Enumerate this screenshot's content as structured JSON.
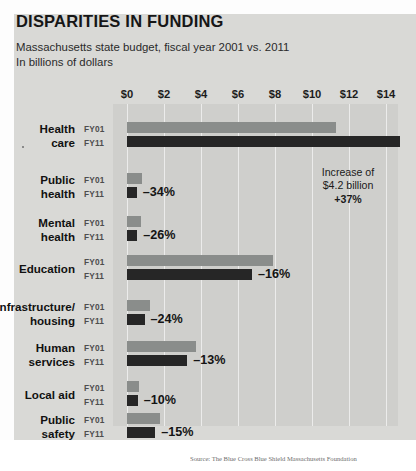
{
  "figure": {
    "title": "DISPARITIES IN FUNDING",
    "subtitle_line1": "Massachusetts state budget, fiscal year 2001 vs. 2011",
    "subtitle_line2": "In billions of dollars",
    "source": "Source: The Blue Cross Blue Shield Massachusetts Foundation"
  },
  "annotation": {
    "line1": "Increase of",
    "line2": "$4.2 billion",
    "line3": "+37%"
  },
  "series_labels": {
    "fy01": "FY01",
    "fy11": "FY11"
  },
  "colors": {
    "fy01_bar": "#8a8d8b",
    "fy11_bar": "#262626",
    "plot_background": "#cfcfcc",
    "figure_background": "#d9d9d6",
    "gridline": "#ececeb"
  },
  "chart_data": {
    "type": "bar",
    "orientation": "horizontal",
    "title": "DISPARITIES IN FUNDING",
    "subtitle": "Massachusetts state budget, fiscal year 2001 vs. 2011",
    "xlabel": "In billions of dollars",
    "ylabel": "",
    "xlim": [
      0,
      14.8
    ],
    "grid": true,
    "legend": "none",
    "tick_labels": [
      "$0",
      "$2",
      "$4",
      "$6",
      "$8",
      "$10",
      "$12",
      "$14"
    ],
    "tick_values": [
      0,
      2,
      4,
      6,
      8,
      10,
      12,
      14
    ],
    "categories": [
      "Health care",
      "Public health",
      "Mental health",
      "Education",
      "Infrastructure/ housing",
      "Human services",
      "Local aid",
      "Public safety"
    ],
    "series": [
      {
        "name": "FY01",
        "values": [
          11.3,
          0.8,
          0.75,
          7.9,
          1.25,
          3.73,
          0.64,
          1.8
        ]
      },
      {
        "name": "FY11",
        "values": [
          15.5,
          0.53,
          0.55,
          6.75,
          0.95,
          3.25,
          0.58,
          1.53
        ]
      }
    ],
    "change_labels": [
      "+37%",
      "-34%",
      "-26%",
      "-16%",
      "-24%",
      "-13%",
      "-10%",
      "-15%"
    ],
    "annotations": [
      {
        "category": "Health care",
        "text": "Increase of $4.2 billion +37%"
      }
    ]
  },
  "rows": [
    {
      "label_line1": "Health",
      "label_line2": "care",
      "fy01_value": 11.3,
      "fy11_value": 15.5,
      "change": "",
      "show_change": false
    },
    {
      "label_line1": "Public",
      "label_line2": "health",
      "fy01_value": 0.8,
      "fy11_value": 0.53,
      "change": "–34%",
      "show_change": true
    },
    {
      "label_line1": "Mental",
      "label_line2": "health",
      "fy01_value": 0.75,
      "fy11_value": 0.55,
      "change": "–26%",
      "show_change": true
    },
    {
      "label_line1": "Education",
      "label_line2": "",
      "fy01_value": 7.9,
      "fy11_value": 6.75,
      "change": "–16%",
      "show_change": true
    },
    {
      "label_line1": "Infrastructure/",
      "label_line2": "housing",
      "fy01_value": 1.25,
      "fy11_value": 0.95,
      "change": "–24%",
      "show_change": true
    },
    {
      "label_line1": "Human",
      "label_line2": "services",
      "fy01_value": 3.73,
      "fy11_value": 3.25,
      "change": "–13%",
      "show_change": true
    },
    {
      "label_line1": "Local aid",
      "label_line2": "",
      "fy01_value": 0.64,
      "fy11_value": 0.58,
      "change": "–10%",
      "show_change": true
    },
    {
      "label_line1": "Public",
      "label_line2": "safety",
      "fy01_value": 1.8,
      "fy11_value": 1.53,
      "change": "–15%",
      "show_change": true
    }
  ]
}
